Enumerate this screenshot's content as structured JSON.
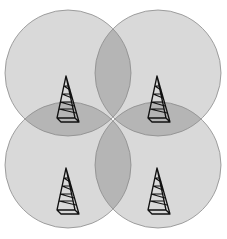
{
  "diagram": {
    "title": "",
    "cells": [
      {
        "name": "top-left",
        "tower": "radio-tower"
      },
      {
        "name": "top-right",
        "tower": "radio-tower"
      },
      {
        "name": "bottom-left",
        "tower": "radio-tower"
      },
      {
        "name": "bottom-right",
        "tower": "radio-tower"
      }
    ],
    "colors": {
      "coverage": "#d9d9d9",
      "overlap": "#b5b5b5",
      "stroke": "#8a8a8a",
      "tower": "#111111",
      "background": "#ffffff"
    }
  }
}
